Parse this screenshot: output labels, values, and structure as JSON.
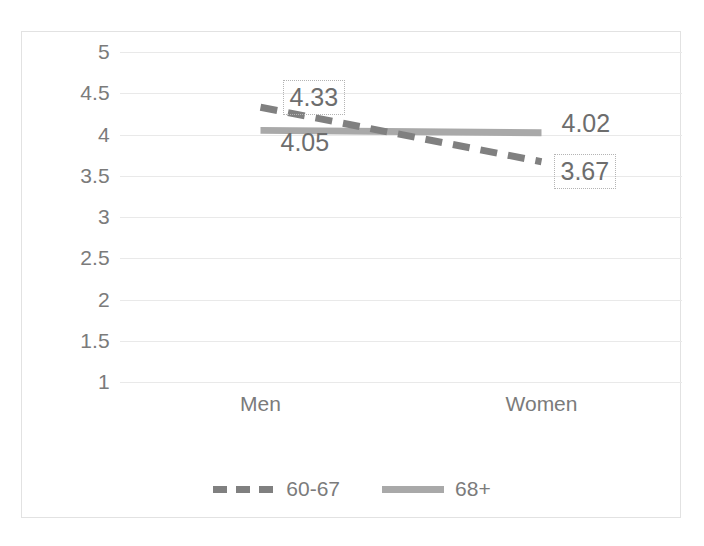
{
  "chart_data": {
    "type": "line",
    "title": "",
    "subtitle": "",
    "xlabel": "",
    "ylabel": "",
    "categories": [
      "Men",
      "Women"
    ],
    "series": [
      {
        "name": "60-67",
        "values": [
          4.33,
          3.67
        ],
        "style": "dashed",
        "color": "#808080"
      },
      {
        "name": "68+",
        "values": [
          4.05,
          4.02
        ],
        "style": "solid",
        "color": "#a9a9a9"
      }
    ],
    "ylim": [
      1,
      5
    ],
    "ytick_step": 0.5,
    "ytick_labels": [
      "5",
      "4.5",
      "4",
      "3.5",
      "3",
      "2.5",
      "2",
      "1.5",
      "1"
    ],
    "ytick_values": [
      5,
      4.5,
      4,
      3.5,
      3,
      2.5,
      2,
      1.5,
      1
    ],
    "grid": true,
    "legend_position": "bottom",
    "data_labels": [
      {
        "text": "4.33",
        "series": "60-67",
        "category": "Men",
        "boxed": true
      },
      {
        "text": "4.05",
        "series": "68+",
        "category": "Men",
        "boxed": false
      },
      {
        "text": "4.02",
        "series": "68+",
        "category": "Women",
        "boxed": false
      },
      {
        "text": "3.67",
        "series": "60-67",
        "category": "Women",
        "boxed": true
      }
    ]
  },
  "axes": {
    "y_labels": [
      "5",
      "4.5",
      "4",
      "3.5",
      "3",
      "2.5",
      "2",
      "1.5",
      "1"
    ],
    "x_labels": [
      "Men",
      "Women"
    ]
  },
  "legend": {
    "items": [
      {
        "label": "60-67"
      },
      {
        "label": "68+"
      }
    ]
  },
  "labels": {
    "men_60_67": "4.33",
    "men_68plus": "4.05",
    "women_68plus": "4.02",
    "women_60_67": "3.67"
  },
  "colors": {
    "series_60_67": "#808080",
    "series_68plus": "#a9a9a9",
    "gridline": "#e9e9e9",
    "frame": "#e2e2e2",
    "text": "#7b7b7b",
    "label_text": "#6d6d6d",
    "label_box_border": "#b4b4b4"
  }
}
